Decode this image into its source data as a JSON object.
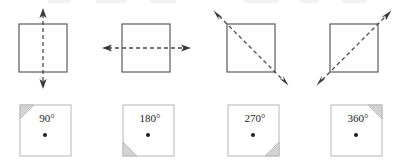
{
  "figure": {
    "canvas": {
      "width": 394,
      "height": 164,
      "background": "#ffffff"
    },
    "colors": {
      "square_stroke_top": "#4b4b4b",
      "square_stroke_bottom": "#b6b6b6",
      "dashed_line": "#4a4a4a",
      "arrow_head": "#3a3a3a",
      "corner_wedge_fill": "#d3d3d3",
      "center_dot": "#1d1d1d",
      "text": "#1d1d1d"
    }
  },
  "symmetry_row": {
    "row_label": "lines-of-symmetry",
    "items": [
      {
        "id": "vertical-axis",
        "axis_name": "vertical line of symmetry",
        "orientation": "vertical",
        "square": {
          "x": 19,
          "y": 24,
          "size": 48
        },
        "line": {
          "x1": 43,
          "y1": 10,
          "x2": 43,
          "y2": 87
        },
        "arrow_ends": "both"
      },
      {
        "id": "horizontal-axis",
        "axis_name": "horizontal line of symmetry",
        "orientation": "horizontal",
        "square": {
          "x": 122,
          "y": 24,
          "size": 48
        },
        "line": {
          "x1": 103,
          "y1": 48,
          "x2": 190,
          "y2": 48
        },
        "arrow_ends": "both"
      },
      {
        "id": "main-diagonal-axis",
        "axis_name": "diagonal line of symmetry top-left to bottom-right",
        "orientation": "diagonal-nwse",
        "square": {
          "x": 227,
          "y": 24,
          "size": 48
        },
        "line": {
          "x1": 215,
          "y1": 12,
          "x2": 287,
          "y2": 84
        },
        "arrow_ends": "both"
      },
      {
        "id": "anti-diagonal-axis",
        "axis_name": "diagonal line of symmetry bottom-left to top-right",
        "orientation": "diagonal-swne",
        "square": {
          "x": 330,
          "y": 24,
          "size": 48
        },
        "line": {
          "x1": 318,
          "y1": 84,
          "x2": 390,
          "y2": 12
        },
        "arrow_ends": "both"
      }
    ]
  },
  "rotation_row": {
    "row_label": "rotational-symmetry",
    "items": [
      {
        "id": "rotation-90",
        "label": "90",
        "degree_symbol": "°",
        "full_label": "90°",
        "square": {
          "x": 20,
          "y": 105,
          "size": 51
        },
        "wedge_corner": "top-left",
        "center_dot": {
          "cx": 45,
          "cy": 135
        }
      },
      {
        "id": "rotation-180",
        "label": "180",
        "degree_symbol": "°",
        "full_label": "180°",
        "square": {
          "x": 123,
          "y": 105,
          "size": 51
        },
        "wedge_corner": "bottom-left",
        "center_dot": {
          "cx": 148,
          "cy": 135
        }
      },
      {
        "id": "rotation-270",
        "label": "270",
        "degree_symbol": "°",
        "full_label": "270°",
        "square": {
          "x": 228,
          "y": 105,
          "size": 51
        },
        "wedge_corner": "bottom-right",
        "center_dot": {
          "cx": 253,
          "cy": 135
        }
      },
      {
        "id": "rotation-360",
        "label": "360",
        "degree_symbol": "°",
        "full_label": "360°",
        "square": {
          "x": 331,
          "y": 105,
          "size": 51
        },
        "wedge_corner": "top-right",
        "center_dot": {
          "cx": 356,
          "cy": 135
        }
      }
    ]
  }
}
